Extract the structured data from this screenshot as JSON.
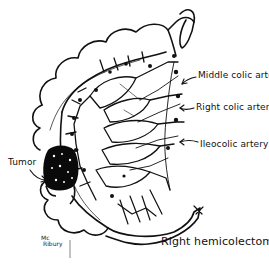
{
  "figure": {
    "title": "Right hemicolectomy",
    "labels": {
      "middle_colic": "Middle colic artery",
      "right_colic": "Right colic artery",
      "ileocolic": "Ileocolic artery",
      "tumor": "Tumor"
    },
    "signature": {
      "line1": "Mc",
      "line2": "Ribury"
    },
    "colors": {
      "ink": "#111111",
      "background": "#ffffff",
      "tumor_fill": "#0a0a0a"
    }
  }
}
